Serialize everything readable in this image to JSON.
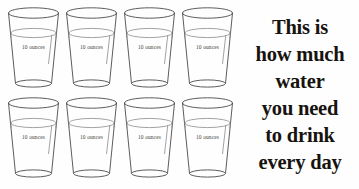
{
  "poster": {
    "background_color": "#fefefe",
    "ink_color": "#17130f",
    "glass_outline_color": "#4a4a4a",
    "glass_label_color": "#3d3d3d",
    "width": 359,
    "height": 189
  },
  "glasses": {
    "label": "10 ounces",
    "rows": [
      {
        "row_name": "top-row",
        "items": [
          {
            "label": "10 ounces",
            "x": 5
          },
          {
            "label": "10 ounces",
            "x": 63
          },
          {
            "label": "10 ounces",
            "x": 121
          },
          {
            "label": "10 ounces",
            "x": 179
          }
        ]
      },
      {
        "row_name": "bottom-row",
        "items": [
          {
            "label": "10 ounces",
            "x": 5
          },
          {
            "label": "10 ounces",
            "x": 63
          },
          {
            "label": "10 ounces",
            "x": 121
          },
          {
            "label": "10 ounces",
            "x": 179
          }
        ]
      }
    ],
    "total_count": 8,
    "unit": "ounces",
    "per_glass_amount": 10
  },
  "caption": {
    "lines": [
      "This is",
      "how much",
      "water",
      "you need",
      "to drink",
      "every day"
    ],
    "full_text": "This is how much water you need to drink every day"
  }
}
